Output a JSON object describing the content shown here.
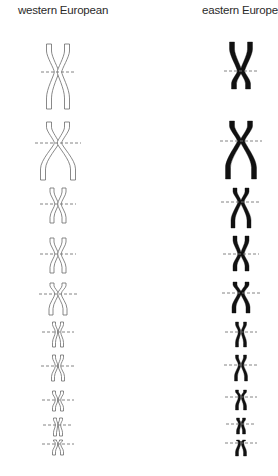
{
  "columns": [
    {
      "id": "western",
      "title": "western European",
      "style": "outline",
      "stroke_color": "#6b6b6b",
      "fill_color": "#ffffff",
      "chromosome_count": 10
    },
    {
      "id": "eastern",
      "title": "eastern European",
      "style": "solid",
      "stroke_color": "#111111",
      "fill_color": "#111111",
      "chromosome_count": 10
    }
  ],
  "centromere_line": {
    "style": "dashed",
    "color": "#777777"
  }
}
